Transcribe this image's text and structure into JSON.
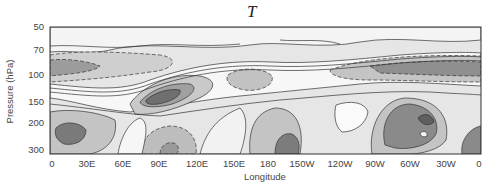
{
  "chart_data": {
    "type": "heatmap",
    "subtype": "filled-contour",
    "title": "T",
    "xlabel": "Longitude",
    "ylabel": "Pressure (hPa)",
    "x_ticks": [
      "0",
      "30E",
      "60E",
      "90E",
      "120E",
      "150E",
      "180",
      "150W",
      "120W",
      "90W",
      "60W",
      "30W",
      "0"
    ],
    "y_ticks": [
      "50",
      "70",
      "100",
      "150",
      "200",
      "300"
    ],
    "x_range": [
      0,
      360
    ],
    "y_range_hPa": [
      300,
      50
    ],
    "y_scale": "log",
    "grid": false,
    "legend": "none",
    "contour_style": "solid lines = positive, dashed lines = negative; grey shading intensity = magnitude",
    "features": [
      {
        "name": "negative band near 80-100 hPa",
        "lon": "0-60E and 150W-0",
        "shade": "dark grey, dashed contours"
      },
      {
        "name": "positive maximum",
        "lon": "~100E",
        "pressure_hPa": 115,
        "shade": "darkest grey"
      },
      {
        "name": "positive maximum",
        "lon": "~15E",
        "pressure_hPa": 230,
        "shade": "dark grey"
      },
      {
        "name": "negative minimum",
        "lon": "~100E",
        "pressure_hPa": 280,
        "shade": "medium grey, dashed"
      },
      {
        "name": "negative minimum",
        "lon": "~165E",
        "pressure_hPa": 100,
        "shade": "medium grey, dashed"
      },
      {
        "name": "positive maximum",
        "lon": "~170W",
        "pressure_hPa": 270,
        "shade": "dark grey"
      },
      {
        "name": "positive maximum",
        "lon": "~60W",
        "pressure_hPa": 220,
        "shade": "dark grey"
      },
      {
        "name": "positive region",
        "lon": "~5W",
        "pressure_hPa": 270,
        "shade": "dark grey"
      }
    ]
  },
  "labels": {
    "title": "T",
    "xlabel": "Longitude",
    "ylabel": "Pressure (hPa)"
  },
  "y_ticks": [
    {
      "label": "50",
      "y": 27
    },
    {
      "label": "70",
      "y": 50
    },
    {
      "label": "100",
      "y": 75
    },
    {
      "label": "150",
      "y": 102
    },
    {
      "label": "200",
      "y": 123
    },
    {
      "label": "300",
      "y": 150
    }
  ],
  "x_ticks": [
    {
      "label": "0",
      "x": 52
    },
    {
      "label": "30E",
      "x": 87
    },
    {
      "label": "60E",
      "x": 123
    },
    {
      "label": "90E",
      "x": 159
    },
    {
      "label": "120E",
      "x": 197
    },
    {
      "label": "150E",
      "x": 234
    },
    {
      "label": "180",
      "x": 268
    },
    {
      "label": "150W",
      "x": 302
    },
    {
      "label": "120W",
      "x": 340
    },
    {
      "label": "90W",
      "x": 375
    },
    {
      "label": "60W",
      "x": 410
    },
    {
      "label": "30W",
      "x": 446
    },
    {
      "label": "0",
      "x": 479
    }
  ],
  "colors": {
    "level1": "#e4e4e4",
    "level2": "#c9c9c9",
    "level3": "#a8a8a8",
    "level4": "#7f7f7f",
    "line": "#333333",
    "frame": "#333333"
  }
}
